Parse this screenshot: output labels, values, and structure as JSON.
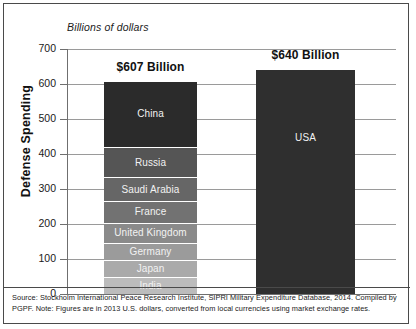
{
  "chart_data": {
    "type": "bar",
    "title": "",
    "subtitle": "Billions of dollars",
    "ylabel": "Defense Spending",
    "xlabel": "",
    "ylim": [
      0,
      700
    ],
    "ytick_labels": [
      "700",
      "600",
      "500",
      "400",
      "300",
      "200",
      "100",
      "0"
    ],
    "ytick_values": [
      700,
      600,
      500,
      400,
      300,
      200,
      100,
      0
    ],
    "grid": true,
    "legend": "none",
    "bars": [
      {
        "name": "allies-stack",
        "total_label": "$607 Billion",
        "total_value": 607,
        "stacked": true,
        "segments": [
          {
            "label": "China",
            "value": 186,
            "color": "#2b2b2b"
          },
          {
            "label": "Russia",
            "value": 88,
            "color": "#555555"
          },
          {
            "label": "Saudi Arabia",
            "value": 67,
            "color": "#666666"
          },
          {
            "label": "France",
            "value": 62,
            "color": "#727272"
          },
          {
            "label": "United Kingdom",
            "value": 57,
            "color": "#8a8a8a"
          },
          {
            "label": "Germany",
            "value": 49,
            "color": "#9b9b9b"
          },
          {
            "label": "Japan",
            "value": 49,
            "color": "#aaaaaa"
          },
          {
            "label": "India",
            "value": 49,
            "color": "#bcbcbc"
          }
        ]
      },
      {
        "name": "usa-bar",
        "total_label": "$640 Billion",
        "total_value": 640,
        "stacked": false,
        "segments": [
          {
            "label": "USA",
            "value": 640,
            "color": "#2f2f2f"
          }
        ]
      }
    ]
  },
  "footnote": {
    "text": "Source: Stockholm International Peace Research Institute, SIPRI Military Expenditure Database, 2014. Compiled by PGPF. Note: Figures are in 2013 U.S. dollars, converted from local currencies using market exchange rates."
  }
}
